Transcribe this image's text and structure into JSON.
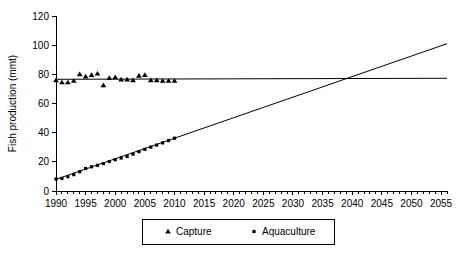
{
  "chart_data": {
    "type": "scatter",
    "title": "",
    "subtitle": "",
    "xlabel": "",
    "ylabel": "Fish production (mmt)",
    "xlim": [
      1990,
      2056
    ],
    "ylim": [
      0,
      120
    ],
    "grid": false,
    "legend_position": "bottom",
    "x_ticks": [
      1990,
      1995,
      2000,
      2005,
      2010,
      2015,
      2020,
      2025,
      2030,
      2035,
      2040,
      2045,
      2050,
      2055
    ],
    "x_tick_labels": [
      "1990",
      "1995",
      "2000",
      "2005",
      "2010",
      "2015",
      "2020",
      "2025",
      "2030",
      "2035",
      "2040",
      "2045",
      "2050",
      "2055"
    ],
    "x_minor_tick_step": 1,
    "y_ticks": [
      0,
      20,
      40,
      60,
      80,
      100,
      120
    ],
    "y_tick_labels": [
      "0",
      "20",
      "40",
      "60",
      "80",
      "100",
      "120"
    ],
    "series": [
      {
        "name": "Capture",
        "marker": "triangle",
        "color": "#000000",
        "x": [
          1990,
          1991,
          1992,
          1993,
          1994,
          1995,
          1996,
          1997,
          1998,
          1999,
          2000,
          2001,
          2002,
          2003,
          2004,
          2005,
          2006,
          2007,
          2008,
          2009,
          2010
        ],
        "values": [
          76,
          74.5,
          74.5,
          75.5,
          80,
          78.5,
          79.5,
          80.5,
          72.5,
          77.5,
          78,
          76.5,
          76.5,
          76,
          79,
          79.5,
          76,
          76,
          75.5,
          75.5,
          75.5
        ],
        "trend": {
          "x": [
            1990,
            2056
          ],
          "y": [
            76.6,
            77.3
          ]
        }
      },
      {
        "name": "Aquaculture",
        "marker": "square",
        "color": "#000000",
        "x": [
          1990,
          1991,
          1992,
          1993,
          1994,
          1995,
          1996,
          1997,
          1998,
          1999,
          2000,
          2001,
          2002,
          2003,
          2004,
          2005,
          2006,
          2007,
          2008,
          2009,
          2010
        ],
        "values": [
          8.2,
          8.6,
          9.8,
          11.2,
          13.2,
          15.4,
          16.6,
          17.6,
          18.8,
          20.2,
          21.5,
          22.6,
          23.7,
          25.3,
          27.0,
          28.6,
          30.1,
          31.5,
          33.0,
          34.6,
          36.2
        ],
        "trend": {
          "x": [
            1990,
            2056
          ],
          "y": [
            8.0,
            101.0
          ]
        }
      }
    ],
    "legend": [
      {
        "label": "Capture",
        "marker": "triangle"
      },
      {
        "label": "Aquaculture",
        "marker": "square"
      }
    ]
  }
}
